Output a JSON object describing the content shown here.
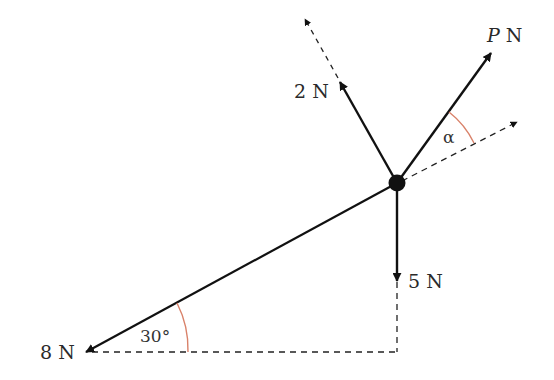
{
  "diagram": {
    "type": "force diagram",
    "colors": {
      "line": "#111111",
      "angle_arc": "#d9826a",
      "text": "#2a2a2a"
    },
    "particle": {
      "x": 397,
      "y": 183
    },
    "forces": [
      {
        "id": "force-8n",
        "label": "8 N",
        "direction": "down-left, 30° below horizontal",
        "tip": [
          85,
          352
        ]
      },
      {
        "id": "force-5n",
        "label": "5 N",
        "direction": "vertically down",
        "tip": [
          397,
          280
        ]
      },
      {
        "id": "force-2n",
        "label": "2 N",
        "direction": "up-left, perpendicular to 8 N line",
        "tip": [
          340,
          82
        ]
      },
      {
        "id": "force-p",
        "label_main": "P",
        "label_unit": " N",
        "direction": "at angle α above the 8 N line direction",
        "tip": [
          492,
          52
        ]
      }
    ],
    "angles": [
      {
        "id": "angle-30",
        "label": "30°"
      },
      {
        "id": "angle-alpha",
        "label": "α"
      }
    ]
  }
}
